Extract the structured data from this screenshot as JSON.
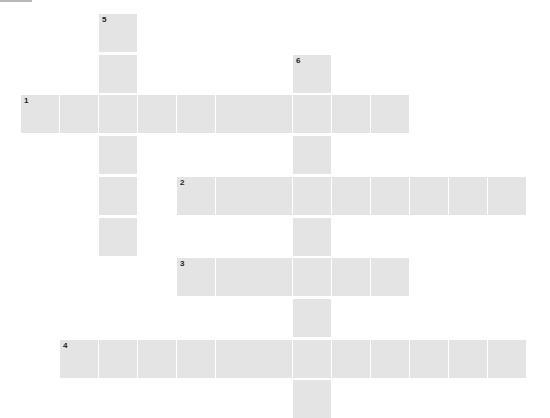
{
  "puzzle": {
    "cell_color": "#e4e4e4",
    "background": "#ffffff",
    "number_color": "#222222",
    "cell_size": 38,
    "col_pitch": 38.9,
    "row_pitch": 40.7,
    "origin_x": 21,
    "origin_y": 14
  },
  "entries": [
    {
      "number": "1",
      "direction": "across",
      "row": 2,
      "col": 0,
      "length": 10
    },
    {
      "number": "2",
      "direction": "across",
      "row": 4,
      "col": 4,
      "length": 9
    },
    {
      "number": "3",
      "direction": "across",
      "row": 6,
      "col": 4,
      "length": 6
    },
    {
      "number": "4",
      "direction": "across",
      "row": 8,
      "col": 1,
      "length": 12
    },
    {
      "number": "5",
      "direction": "down",
      "row": 0,
      "col": 2,
      "length": 6
    },
    {
      "number": "6",
      "direction": "down",
      "row": 1,
      "col": 7,
      "length": 9
    }
  ]
}
